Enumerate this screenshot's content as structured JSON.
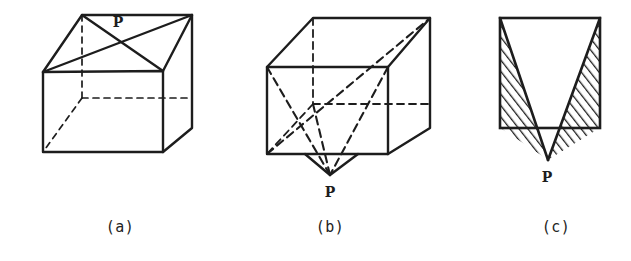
{
  "figure": {
    "background_color": "#ffffff",
    "ink_color": "#1d1d1d",
    "panels": [
      {
        "id": "a",
        "caption": "(a)",
        "caption_x": 120,
        "caption_y": 227,
        "description": "Oblique-projection cube with diagonals drawn on the top face meeting at point P",
        "point_label": "P",
        "point_label_x": 118,
        "point_label_y": 22,
        "vertices": {
          "top_front_left": [
            43,
            72
          ],
          "top_front_right": [
            163,
            71
          ],
          "top_back_left": [
            82,
            15
          ],
          "top_back_right": [
            192,
            15
          ],
          "bottom_front_left": [
            43,
            152
          ],
          "bottom_front_right": [
            163,
            152
          ],
          "bottom_back_left": [
            82,
            98
          ],
          "bottom_back_right": [
            192,
            128
          ]
        },
        "hidden_edges": [
          "top_back_left-bottom_back_left",
          "bottom_back_left-bottom_front_left",
          "bottom_back_left-bottom_back_right"
        ]
      },
      {
        "id": "b",
        "caption": "(b)",
        "caption_x": 330,
        "caption_y": 227,
        "description": "Cube in wireframe with dashed diagonals converging at apex P below the bottom face",
        "point_label": "P",
        "point_label_x": 330,
        "point_label_y": 192,
        "vertices": {
          "top_front_left": [
            267,
            67
          ],
          "top_front_right": [
            388,
            67
          ],
          "top_back_left": [
            313,
            18
          ],
          "top_back_right": [
            430,
            18
          ],
          "bottom_front_left": [
            267,
            154
          ],
          "bottom_front_right": [
            388,
            154
          ],
          "bottom_back_left": [
            313,
            104
          ],
          "bottom_back_right": [
            430,
            128
          ]
        },
        "apex": [
          330,
          175
        ],
        "hidden_edges": [
          "top_back_left-bottom_back_left",
          "bottom_back_left-bottom_front_left",
          "bottom_back_left-bottom_back_right"
        ]
      },
      {
        "id": "c",
        "caption": "(c)",
        "caption_x": 556,
        "caption_y": 227,
        "description": "Front elevation: square with V-shaped notch, hatched side regions and a small hatched spike down to P",
        "point_label": "P",
        "point_label_x": 547,
        "point_label_y": 177,
        "square": {
          "left": 500,
          "top": 18,
          "right": 600,
          "bottom": 128
        },
        "notch_apex": [
          548,
          160
        ],
        "hatch_angle_deg": 38,
        "hatch_spacing_px": 5
      }
    ]
  }
}
